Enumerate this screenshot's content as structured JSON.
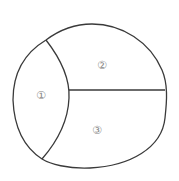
{
  "diagram": {
    "stroke_color": "#3a3a3a",
    "label_color": "#888888",
    "regions": [
      {
        "id": "1",
        "label": "①",
        "x": 41,
        "y": 95
      },
      {
        "id": "2",
        "label": "②",
        "x": 102,
        "y": 65
      },
      {
        "id": "3",
        "label": "③",
        "x": 97,
        "y": 130
      }
    ]
  }
}
